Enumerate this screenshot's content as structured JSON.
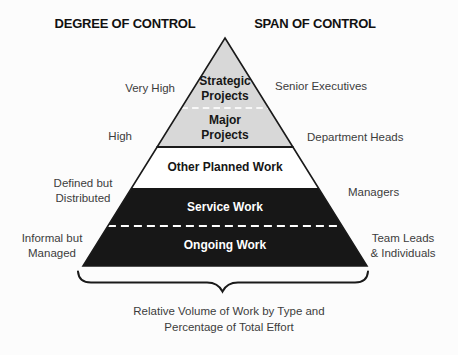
{
  "headings": {
    "left": "DEGREE OF CONTROL",
    "right": "SPAN OF CONTROL"
  },
  "pyramid": {
    "sections": [
      {
        "label": [
          "Strategic",
          "Projects"
        ]
      },
      {
        "label": [
          "Major",
          "Projects"
        ]
      },
      {
        "label": "Other Planned Work"
      },
      {
        "label": "Service Work"
      },
      {
        "label": "Ongoing Work"
      }
    ],
    "colors": {
      "top_fill": "#d8d8d8",
      "middle_fill": "#ffffff",
      "bottom_fill": "#171717",
      "outline": "#1a1a1a",
      "dash": "#f8f8f8"
    }
  },
  "degree_labels": [
    "Very High",
    "High",
    [
      "Defined but",
      "Distributed"
    ],
    [
      "Informal but",
      "Managed"
    ]
  ],
  "span_labels": [
    "Senior Executives",
    "Department Heads",
    "Managers",
    [
      "Team Leads",
      "& Individuals"
    ]
  ],
  "caption": [
    "Relative Volume of Work by Type and",
    "Percentage of Total Effort"
  ]
}
